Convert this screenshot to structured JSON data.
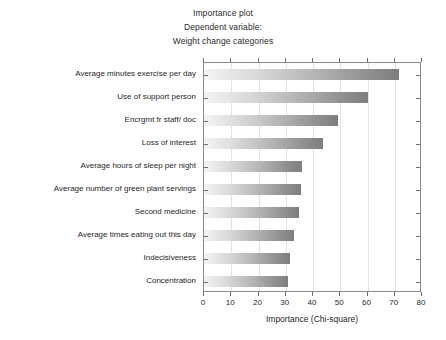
{
  "title": {
    "line1": "Importance plot",
    "line2": "Dependent variable:",
    "line3": "Weight change categories"
  },
  "axis": {
    "xlabel": "Importance (Chi-square)",
    "xticks": [
      "0",
      "10",
      "20",
      "30",
      "40",
      "50",
      "60",
      "70",
      "80"
    ]
  },
  "colors": {
    "bar_light": "#f4f4f4",
    "bar_dark": "#7e7e7e",
    "frame": "#8a8a8a",
    "grid": "#e2e2e2",
    "text": "#1f1f1f"
  },
  "chart_data": {
    "type": "bar",
    "orientation": "horizontal",
    "title": "Importance plot\nDependent variable:\nWeight change categories",
    "xlabel": "Importance (Chi-square)",
    "ylabel": "",
    "xlim": [
      0,
      80
    ],
    "xticks": [
      0,
      10,
      20,
      30,
      40,
      50,
      60,
      70,
      80
    ],
    "grid": true,
    "legend": false,
    "categories": [
      "Average minutes exercise per day",
      "Use of support person",
      "Encrgmt fr staff/ doc",
      "Loss of interest",
      "Average hours of sleep per night",
      "Average number of green plant servings",
      "Second medicine",
      "Average times eating out this day",
      "Indecisiveness",
      "Concentration"
    ],
    "values": [
      71.5,
      60.0,
      49.0,
      43.5,
      36.0,
      35.5,
      35.0,
      33.0,
      31.5,
      31.0
    ]
  }
}
